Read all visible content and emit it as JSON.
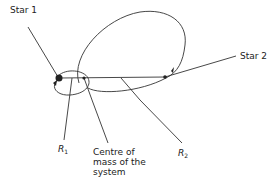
{
  "figure": {
    "labels": {
      "star1": "Star 1",
      "star2": "Star 2",
      "r1_main": "R",
      "r1_sub": "1",
      "r2_main": "R",
      "r2_sub": "2",
      "com_line1": "Centre of",
      "com_line2": "mass of the",
      "com_line3": "system"
    },
    "colors": {
      "stroke": "#333333",
      "text": "#222222"
    }
  }
}
